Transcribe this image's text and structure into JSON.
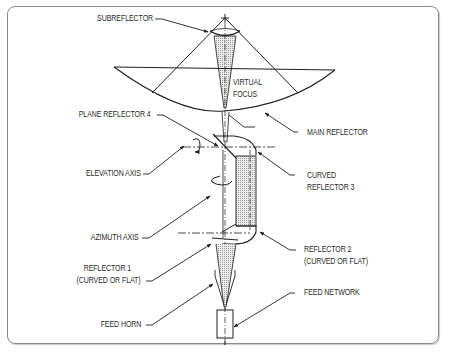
{
  "diagram": {
    "title": "",
    "labels": {
      "subreflector": "SUBREFLECTOR",
      "virtual_focus_1": "VIRTUAL",
      "virtual_focus_2": "FOCUS",
      "plane_reflector_4": "PLANE REFLECTOR 4",
      "main_reflector": "MAIN REFLECTOR",
      "elevation_axis": "ELEVATION AXIS",
      "curved_reflector_3_1": "CURVED",
      "curved_reflector_3_2": "REFLECTOR 3",
      "azimuth_axis": "AZIMUTH AXIS",
      "reflector_2_1": "REFLECTOR 2",
      "reflector_2_2": "(CURVED OR FLAT)",
      "reflector_1_1": "REFLECTOR 1",
      "reflector_1_2": "(CURVED OR FLAT)",
      "feed_horn": "FEED HORN",
      "feed_network": "FEED NETWORK"
    },
    "colors": {
      "line": "#1e1e1e",
      "frame": "#8a8a8a",
      "hatch_fill": "#d9d9d9"
    }
  }
}
